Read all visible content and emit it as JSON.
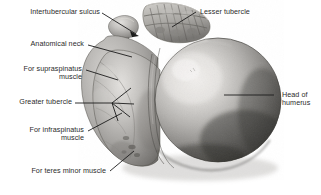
{
  "figure": {
    "view": "superior view of right humerus head",
    "background_color": "#ffffff",
    "bone_tone_light": "#e9e7e4",
    "bone_tone_mid": "#9e9c99",
    "bone_tone_dark": "#3a3936",
    "leader_color": "#1c1c1c"
  },
  "labels": {
    "intertubercular_sulcus": "Intertubercular sulcus",
    "anatomical_neck": "Anatomical neck",
    "supraspinatus_line1": "For supraspinatus",
    "supraspinatus_line2": "muscle",
    "greater_tubercle": "Greater tubercle",
    "infraspinatus_line1": "For infraspinatus",
    "infraspinatus_line2": "muscle",
    "teres_minor": "For teres minor muscle",
    "lesser_tubercle": "Lesser tubercle",
    "head_of_humerus_line1": "Head of",
    "head_of_humerus_line2": "humerus"
  },
  "caption": {
    "text": ""
  }
}
